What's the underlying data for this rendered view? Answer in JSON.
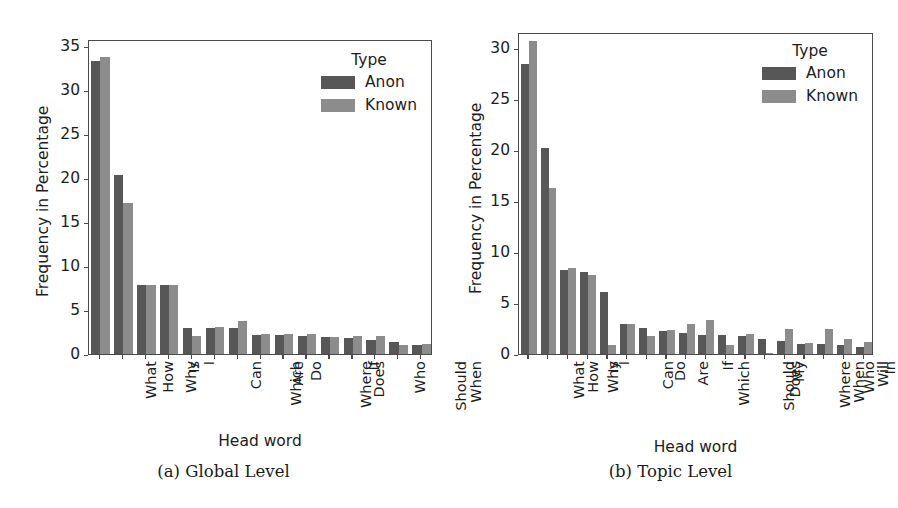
{
  "figure": {
    "panels": [
      {
        "caption": "(a) Global Level",
        "legend_title": "Type",
        "chart_data": {
          "type": "bar",
          "title": "",
          "xlabel": "Head word",
          "ylabel": "Frequency in Percentage",
          "ylim": [
            0,
            35.8
          ],
          "yticks": [
            0,
            5,
            10,
            15,
            20,
            25,
            30,
            35
          ],
          "grid": false,
          "legend_position": "upper right",
          "categories": [
            "What",
            "How",
            "Why",
            "Is",
            "I",
            "Can",
            "Which",
            "Are",
            "Do",
            "Where",
            "Does",
            "If",
            "Who",
            "Should",
            "When"
          ],
          "series": [
            {
              "name": "Anon",
              "color": "#575757",
              "values": [
                33.3,
                20.3,
                7.9,
                7.8,
                3.0,
                3.0,
                2.9,
                2.2,
                2.2,
                2.1,
                1.9,
                1.8,
                1.6,
                1.4,
                1.0
              ]
            },
            {
              "name": "Known",
              "color": "#8c8c8c",
              "values": [
                33.8,
                17.2,
                7.9,
                7.8,
                2.0,
                3.1,
                3.7,
                2.3,
                2.3,
                2.3,
                1.9,
                2.0,
                2.0,
                1.0,
                1.1
              ]
            }
          ]
        }
      },
      {
        "caption": "(b) Topic Level",
        "legend_title": "Type",
        "chart_data": {
          "type": "bar",
          "title": "",
          "xlabel": "Head word",
          "ylabel": "Frequency in Percentage",
          "ylim": [
            0,
            31.6
          ],
          "yticks": [
            0,
            5,
            10,
            15,
            20,
            25,
            30
          ],
          "grid": false,
          "legend_position": "upper right",
          "categories": [
            "What",
            "How",
            "Why",
            "Is",
            "I",
            "Can",
            "Do",
            "Are",
            "Which",
            "If",
            "Should",
            "Does",
            "My",
            "Where",
            "When",
            "Who",
            "Will",
            "In"
          ],
          "series": [
            {
              "name": "Anon",
              "color": "#575757",
              "values": [
                28.5,
                20.2,
                8.2,
                8.0,
                6.1,
                2.9,
                2.6,
                2.3,
                2.1,
                1.9,
                1.9,
                1.8,
                1.5,
                1.3,
                1.0,
                1.0,
                0.9,
                0.7
              ]
            },
            {
              "name": "Known",
              "color": "#8c8c8c",
              "values": [
                30.7,
                16.3,
                8.4,
                7.8,
                0.9,
                2.9,
                1.8,
                2.4,
                2.9,
                3.3,
                0.9,
                2.0,
                0.1,
                2.5,
                1.1,
                2.5,
                1.5,
                1.2
              ]
            }
          ]
        }
      }
    ]
  }
}
